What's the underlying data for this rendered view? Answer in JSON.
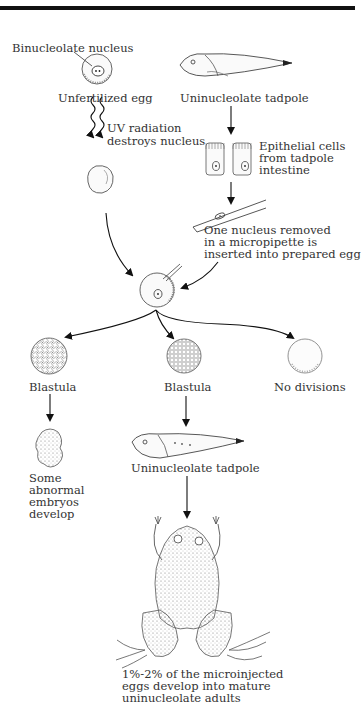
{
  "figure": {
    "labels": {
      "binucleolate_nucleus": "Binucleolate nucleus",
      "unfertilized_egg": "Unfertilized egg",
      "uninucleolate_tadpole_top": "Uninucleolate tadpole",
      "uv_radiation_line1": "UV radiation",
      "uv_radiation_line2": "destroys nucleus",
      "epithelial_line1": "Epithelial cells",
      "epithelial_line2": "from tadpole",
      "epithelial_line3": "intestine",
      "micropipette_line1": "One nucleus removed",
      "micropipette_line2": "in a micropipette is",
      "micropipette_line3": "inserted into prepared egg",
      "blastula_left": "Blastula",
      "blastula_middle": "Blastula",
      "no_divisions": "No divisions",
      "abnormal_line1": "Some",
      "abnormal_line2": "abnormal",
      "abnormal_line3": "embryos",
      "abnormal_line4": "develop",
      "uninucleolate_tadpole_bottom": "Uninucleolate tadpole",
      "result_line1": "1%-2% of the microinjected",
      "result_line2": "eggs develop into mature",
      "result_line3": "uninucleolate adults"
    }
  }
}
